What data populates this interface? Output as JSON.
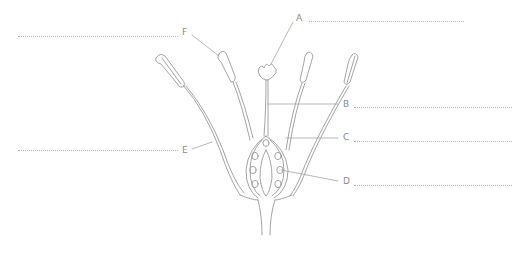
{
  "diagram": {
    "type": "labelled botanical diagram",
    "labels": [
      {
        "id": "A",
        "text": "A",
        "answer_blank": ""
      },
      {
        "id": "B",
        "text": "B",
        "answer_blank": ""
      },
      {
        "id": "C",
        "text": "C",
        "answer_blank": ""
      },
      {
        "id": "D",
        "text": "D",
        "answer_blank": ""
      },
      {
        "id": "E",
        "text": "E",
        "answer_blank": ""
      },
      {
        "id": "F",
        "text": "F",
        "answer_blank": ""
      }
    ],
    "colors": {
      "line": "#9a9a9a",
      "label": "#8a8a8a",
      "dotted": "#b5b5b5",
      "background": "#ffffff"
    }
  }
}
